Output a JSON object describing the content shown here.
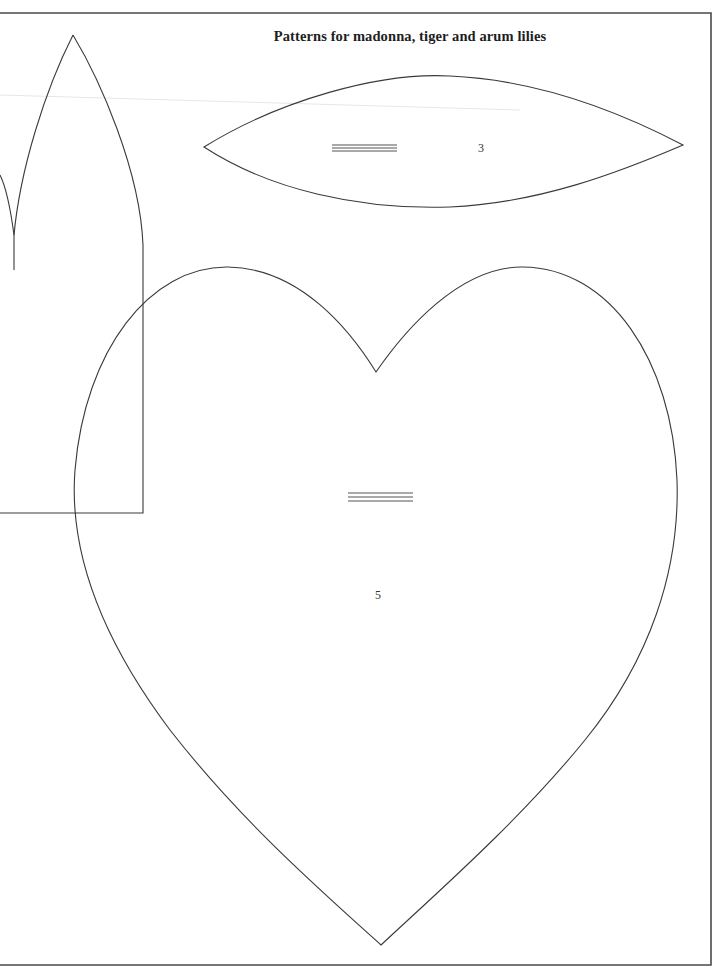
{
  "page": {
    "title": "Patterns for madonna, tiger and arum lilies"
  },
  "patterns": [
    {
      "id": "petal-3",
      "label": "3",
      "shape": "pointed-oval petal",
      "has_grain_line": true
    },
    {
      "id": "heart-5",
      "label": "5",
      "shape": "heart",
      "has_grain_line": true
    },
    {
      "id": "left-petal",
      "label": "",
      "shape": "pointed arch petal with square base (partially cut off)",
      "has_grain_line": false
    }
  ],
  "colors": {
    "paper": "#ffffff",
    "ink": "#3a3a3a",
    "frame": "#4a4a4a"
  }
}
